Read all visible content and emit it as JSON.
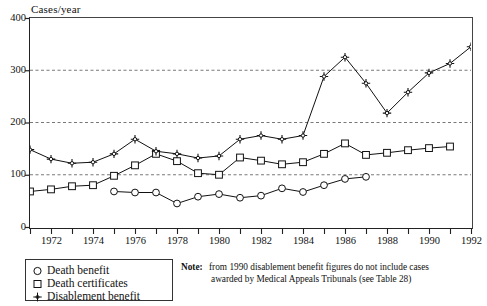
{
  "chart_data": {
    "type": "line",
    "title": "",
    "ylabel": "Cases/year",
    "xlabel": "",
    "ylim": [
      0,
      400
    ],
    "xlim": [
      1971,
      1992
    ],
    "yticks": [
      0,
      100,
      200,
      300,
      400
    ],
    "ytick_labels": [
      "0",
      "100",
      "200",
      "300",
      "400"
    ],
    "xticks": [
      1971,
      1972,
      1973,
      1974,
      1975,
      1976,
      1977,
      1978,
      1979,
      1980,
      1981,
      1982,
      1983,
      1984,
      1985,
      1986,
      1987,
      1988,
      1989,
      1990,
      1991,
      1992
    ],
    "xtick_labels_shown": [
      "1972",
      "1974",
      "1976",
      "1978",
      "1980",
      "1982",
      "1984",
      "1986",
      "1988",
      "1990",
      "1992"
    ],
    "grid": "horizontal-dashed at 100, 200, 300",
    "legend_position": "below-left",
    "series": [
      {
        "name": "Death benefit",
        "marker": "circle",
        "x": [
          1975,
          1976,
          1977,
          1978,
          1979,
          1980,
          1981,
          1982,
          1983,
          1984,
          1985,
          1986,
          1987
        ],
        "values": [
          68,
          66,
          66,
          45,
          58,
          63,
          56,
          60,
          74,
          67,
          80,
          92,
          96
        ]
      },
      {
        "name": "Death certificates",
        "marker": "square",
        "x": [
          1971,
          1972,
          1973,
          1974,
          1975,
          1976,
          1977,
          1978,
          1979,
          1980,
          1981,
          1982,
          1983,
          1984,
          1985,
          1986,
          1987,
          1988,
          1989,
          1990,
          1991
        ],
        "values": [
          68,
          72,
          78,
          80,
          98,
          118,
          140,
          126,
          103,
          100,
          133,
          127,
          120,
          124,
          140,
          160,
          138,
          142,
          147,
          151,
          154
        ]
      },
      {
        "name": "Disablement benefit",
        "marker": "cross",
        "x": [
          1971,
          1972,
          1973,
          1974,
          1975,
          1976,
          1977,
          1978,
          1979,
          1980,
          1981,
          1982,
          1983,
          1984,
          1985,
          1986,
          1987,
          1988,
          1989,
          1990,
          1991,
          1992
        ],
        "values": [
          148,
          130,
          122,
          124,
          140,
          168,
          145,
          140,
          132,
          136,
          168,
          175,
          168,
          175,
          288,
          325,
          275,
          218,
          258,
          295,
          313,
          345
        ]
      }
    ]
  },
  "legend": {
    "items": [
      {
        "label": "Death benefit",
        "marker": "circle"
      },
      {
        "label": "Death certificates",
        "marker": "square"
      },
      {
        "label": "Disablement benefit",
        "marker": "cross"
      }
    ]
  },
  "note": {
    "prefix": "Note:",
    "line1": "from 1990 disablement benefit  figures do not include cases",
    "line2": "awarded by Medical  Appeals Tribunals (see Table 28)"
  },
  "colors": {
    "ink": "#111111",
    "axis": "#222222",
    "grid": "#555555"
  }
}
